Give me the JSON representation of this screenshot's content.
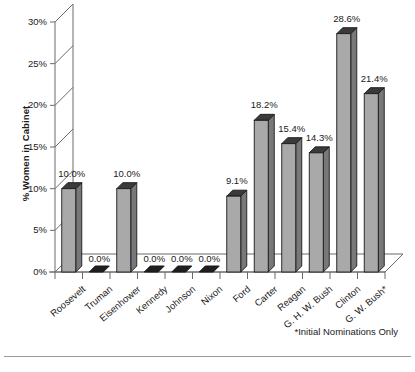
{
  "chart_data": {
    "type": "bar",
    "title": "",
    "subtitle": "",
    "xlabel": "",
    "ylabel": "% Women in Cabinet",
    "ylim": [
      0,
      30
    ],
    "grid": false,
    "legend": null,
    "legend_position": "none",
    "y_tick_labels": [
      "0%",
      "5%",
      "10%",
      "15%",
      "20%",
      "25%",
      "30%"
    ],
    "y_tick_values": [
      0,
      5,
      10,
      15,
      20,
      25,
      30
    ],
    "categories": [
      "Roosevelt",
      "Truman",
      "Eisenhower",
      "Kennedy",
      "Johnson",
      "Nixon",
      "Ford",
      "Carter",
      "Reagan",
      "G. H. W. Bush",
      "Clinton",
      "G. W. Bush*"
    ],
    "values": [
      10.0,
      0.0,
      10.0,
      0.0,
      0.0,
      0.0,
      9.1,
      18.2,
      15.4,
      14.3,
      28.6,
      21.4
    ],
    "value_labels": [
      "10.0%",
      "0.0%",
      "10.0%",
      "0.0%",
      "0.0%",
      "0.0%",
      "9.1%",
      "18.2%",
      "15.4%",
      "14.3%",
      "28.6%",
      "21.4%"
    ],
    "annotations": [
      "*Initial Nominations Only"
    ],
    "colors": {
      "bar_face": "#a9a9a9",
      "bar_side": "#787878",
      "bar_top": "#3a3a3a",
      "outline": "#1a1a1a",
      "axis": "#6b6b6b",
      "floor": "#ffffff",
      "text": "#1a1a1a",
      "rule": "#9a9a9a"
    }
  },
  "footnote": {
    "text": "*Initial Nominations Only"
  },
  "axes": {
    "y_title": "% Women in Cabinet"
  }
}
